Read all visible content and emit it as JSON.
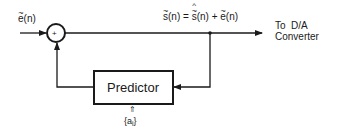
{
  "diagram": {
    "input_label": {
      "base": "e",
      "rest": "(n)"
    },
    "summing_junction": {
      "sign": "+"
    },
    "output_equation": {
      "lhs_base": "s",
      "lhs_rest": "(n)",
      "equals": "=",
      "term1_base": "s",
      "term1_rest": "(n)",
      "plus": "+",
      "term2_base": "e",
      "term2_rest": "(n)"
    },
    "output_label_line1": "To  D/A",
    "output_label_line2": "Converter",
    "predictor_label": "Predictor",
    "coefficients_label": {
      "open": "{",
      "base": "a",
      "sub": "i",
      "close": "}"
    },
    "coefficients_arrow": "⇑",
    "colors": {
      "line": "#1a1a1a",
      "background": "#ffffff"
    }
  }
}
